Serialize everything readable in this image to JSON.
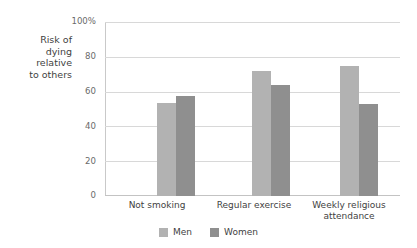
{
  "chart_data": {
    "type": "bar",
    "title": "",
    "subtitle": "",
    "xlabel": "",
    "ylabel": "Risk of\ndying\nrelative\nto others",
    "ylabel_lines": [
      "Risk of",
      "dying",
      "relative",
      "to others"
    ],
    "categories": [
      "Not smoking",
      "Regular exercise",
      "Weekly religious\nattendance"
    ],
    "category_lines": [
      [
        "Not smoking"
      ],
      [
        "Regular exercise"
      ],
      [
        "Weekly religious",
        "attendance"
      ]
    ],
    "series": [
      {
        "name": "Men",
        "values": [
          54,
          72,
          75
        ],
        "color": "#b2b2b2"
      },
      {
        "name": "Women",
        "values": [
          58,
          64,
          53
        ],
        "color": "#8f8f8f"
      }
    ],
    "ylim": [
      0,
      100
    ],
    "ytick_values": [
      100,
      80,
      60,
      40,
      20,
      0
    ],
    "ytick_labels": [
      "100%",
      "80",
      "60",
      "40",
      "20",
      "0"
    ],
    "grid": true,
    "legend_position": "bottom-center",
    "annotations": []
  },
  "style": {
    "background": "#ffffff",
    "grid_color": "#d8d8d8",
    "axis_color": "#c9c9c9",
    "tick_text_color": "#6a6a6a",
    "label_text_color": "#3f3f3f"
  }
}
